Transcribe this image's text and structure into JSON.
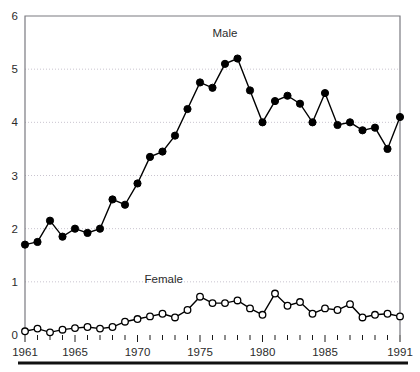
{
  "chart_data": {
    "type": "line",
    "title": "",
    "subtitle": "",
    "xlabel": "",
    "ylabel": "",
    "xlim": [
      1961,
      1991
    ],
    "ylim": [
      0,
      6
    ],
    "ytick_labels": [
      "0",
      "1",
      "2",
      "3",
      "4",
      "5",
      "6"
    ],
    "ytick_values": [
      0,
      1,
      2,
      3,
      4,
      5,
      6
    ],
    "xtick_labels": [
      "1961",
      "1965",
      "1970",
      "1975",
      "1980",
      "1985",
      "1991"
    ],
    "xtick_values": [
      1961,
      1965,
      1970,
      1975,
      1980,
      1985,
      1991
    ],
    "grid": "horizontal-dotted",
    "legend_position": "inline-annotation",
    "x": [
      1961,
      1962,
      1963,
      1964,
      1965,
      1966,
      1967,
      1968,
      1969,
      1970,
      1971,
      1972,
      1973,
      1974,
      1975,
      1976,
      1977,
      1978,
      1979,
      1980,
      1981,
      1982,
      1983,
      1984,
      1985,
      1986,
      1987,
      1988,
      1989,
      1990,
      1991
    ],
    "series": [
      {
        "name": "Male",
        "marker": "filled-circle",
        "color": "#000000",
        "values": [
          1.7,
          1.75,
          2.15,
          1.85,
          2.0,
          1.92,
          2.0,
          2.55,
          2.45,
          2.85,
          3.35,
          3.45,
          3.75,
          4.25,
          4.75,
          4.65,
          5.1,
          5.2,
          4.6,
          4.0,
          4.4,
          4.5,
          4.35,
          4.0,
          4.55,
          3.95,
          4.0,
          3.85,
          3.9,
          3.5,
          4.1
        ]
      },
      {
        "name": "Female",
        "marker": "open-circle",
        "color": "#000000",
        "values": [
          0.07,
          0.12,
          0.05,
          0.1,
          0.13,
          0.15,
          0.12,
          0.15,
          0.25,
          0.3,
          0.35,
          0.4,
          0.33,
          0.47,
          0.72,
          0.6,
          0.6,
          0.65,
          0.5,
          0.38,
          0.78,
          0.55,
          0.62,
          0.4,
          0.5,
          0.47,
          0.58,
          0.33,
          0.38,
          0.4,
          0.35
        ]
      }
    ],
    "annotations": [
      {
        "text": "Male",
        "x": 1977,
        "y": 5.6
      },
      {
        "text": "Female",
        "x": 1972.1,
        "y": 0.98
      }
    ]
  }
}
